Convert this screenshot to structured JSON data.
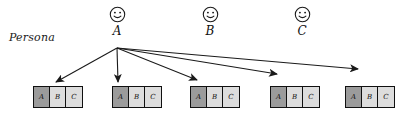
{
  "diagram": {
    "type": "persona-mapping-diagram",
    "side_label": "Persona",
    "colors": {
      "selected_cell": "#9b9b9b",
      "unselected_cell": "#dddddd",
      "stroke": "#101010",
      "background": "#ffffff"
    },
    "personas": [
      {
        "id": "A",
        "label": "A",
        "icon": "smiley-face-icon",
        "x": 117,
        "y": 14,
        "active": true
      },
      {
        "id": "B",
        "label": "B",
        "icon": "smiley-face-icon",
        "x": 210,
        "y": 14,
        "active": false
      },
      {
        "id": "C",
        "label": "C",
        "icon": "smiley-face-icon",
        "x": 302,
        "y": 14,
        "active": false
      }
    ],
    "arrow_source": {
      "persona": "A",
      "x": 117,
      "y": 48
    },
    "arrows": [
      {
        "from": "A",
        "to_group": 0,
        "tip_x": 56,
        "tip_y": 82
      },
      {
        "from": "A",
        "to_group": 1,
        "tip_x": 118,
        "tip_y": 82
      },
      {
        "from": "A",
        "to_group": 2,
        "tip_x": 197,
        "tip_y": 80
      },
      {
        "from": "A",
        "to_group": 3,
        "tip_x": 277,
        "tip_y": 74
      },
      {
        "from": "A",
        "to_group": 4,
        "tip_x": 358,
        "tip_y": 69
      }
    ],
    "cell_headers": [
      "A",
      "B",
      "C"
    ],
    "groups": [
      {
        "index": 0,
        "x": 33,
        "y": 86,
        "cells": [
          {
            "label": "A",
            "state": "dark"
          },
          {
            "label": "B",
            "state": "light"
          },
          {
            "label": "C",
            "state": "light"
          }
        ]
      },
      {
        "index": 1,
        "x": 112,
        "y": 86,
        "cells": [
          {
            "label": "A",
            "state": "dark"
          },
          {
            "label": "B",
            "state": "light"
          },
          {
            "label": "C",
            "state": "light"
          }
        ]
      },
      {
        "index": 2,
        "x": 190,
        "y": 86,
        "cells": [
          {
            "label": "A",
            "state": "dark"
          },
          {
            "label": "B",
            "state": "light"
          },
          {
            "label": "C",
            "state": "light"
          }
        ]
      },
      {
        "index": 3,
        "x": 270,
        "y": 86,
        "cells": [
          {
            "label": "A",
            "state": "dark"
          },
          {
            "label": "B",
            "state": "light"
          },
          {
            "label": "C",
            "state": "light"
          }
        ]
      },
      {
        "index": 4,
        "x": 345,
        "y": 86,
        "cells": [
          {
            "label": "A",
            "state": "dark"
          },
          {
            "label": "B",
            "state": "light"
          },
          {
            "label": "C",
            "state": "light"
          }
        ]
      }
    ]
  }
}
